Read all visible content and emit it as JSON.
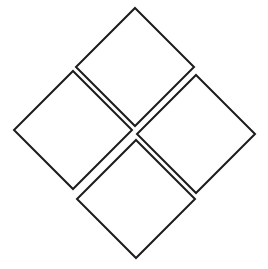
{
  "figure": {
    "type": "line-drawing",
    "background_color": "#ffffff",
    "stroke_color": "#1c1c1c",
    "fill_color": "#ffffff",
    "stroke_width": 2,
    "canvas": {
      "width": 268,
      "height": 269
    },
    "shape_count": 4,
    "center_point": {
      "x": 134,
      "y": 133
    },
    "gap_between_shapes": 4,
    "shapes": [
      {
        "name": "top-diamond",
        "label": "Top",
        "rotation_degrees": 45,
        "points": "135,8 194,67 135,126 76,67",
        "vertices": {
          "top": {
            "x": 135,
            "y": 8
          },
          "right": {
            "x": 194,
            "y": 67
          },
          "bottom": {
            "x": 135,
            "y": 126
          },
          "left": {
            "x": 76,
            "y": 67
          }
        }
      },
      {
        "name": "left-diamond",
        "label": "Left",
        "rotation_degrees": 45,
        "points": "73,71 132,130 73,189 14,130",
        "vertices": {
          "top": {
            "x": 73,
            "y": 71
          },
          "right": {
            "x": 132,
            "y": 130
          },
          "bottom": {
            "x": 73,
            "y": 189
          },
          "left": {
            "x": 14,
            "y": 130
          }
        }
      },
      {
        "name": "right-diamond",
        "label": "Right",
        "rotation_degrees": 45,
        "points": "196,75 255,134 196,193 137,134",
        "vertices": {
          "top": {
            "x": 196,
            "y": 75
          },
          "right": {
            "x": 255,
            "y": 134
          },
          "bottom": {
            "x": 196,
            "y": 193
          },
          "left": {
            "x": 137,
            "y": 134
          }
        }
      },
      {
        "name": "bottom-diamond",
        "label": "Bottom",
        "rotation_degrees": 45,
        "points": "136,140 195,199 136,258 77,199",
        "vertices": {
          "top": {
            "x": 136,
            "y": 140
          },
          "right": {
            "x": 195,
            "y": 199
          },
          "bottom": {
            "x": 136,
            "y": 258
          },
          "left": {
            "x": 77,
            "y": 199
          }
        }
      }
    ]
  }
}
